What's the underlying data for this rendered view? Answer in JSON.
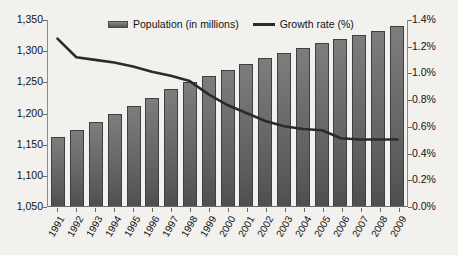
{
  "chart_data": {
    "type": "bar",
    "title": "",
    "xlabel": "",
    "ylabel": "",
    "grid": false,
    "legend_position": "top-center",
    "categories": [
      "1991",
      "1992",
      "1993",
      "1994",
      "1995",
      "1996",
      "1997",
      "1998",
      "1999",
      "2000",
      "2001",
      "2002",
      "2003",
      "2004",
      "2005",
      "2006",
      "2007",
      "2008",
      "2009"
    ],
    "series": [
      {
        "name": "Population (in millions)",
        "type": "bar",
        "axis": "left",
        "unit": "millions",
        "color": "#6e6e6e",
        "values": [
          1160,
          1172,
          1185,
          1198,
          1211,
          1224,
          1237,
          1249,
          1259,
          1268,
          1278,
          1287,
          1295,
          1303,
          1311,
          1318,
          1324,
          1331,
          1338
        ]
      },
      {
        "name": "Growth rate (%)",
        "type": "line",
        "axis": "right",
        "unit": "%",
        "color": "#2b2b2b",
        "values": [
          1.26,
          1.12,
          1.1,
          1.08,
          1.05,
          1.01,
          0.98,
          0.94,
          0.84,
          0.76,
          0.7,
          0.64,
          0.6,
          0.58,
          0.57,
          0.51,
          0.5,
          0.5,
          0.5
        ]
      }
    ],
    "left_axis": {
      "min": 1050,
      "max": 1350,
      "step": 50,
      "ticks": [
        1050,
        1100,
        1150,
        1200,
        1250,
        1300,
        1350
      ],
      "tick_labels": [
        "1,050",
        "1,100",
        "1,150",
        "1,200",
        "1,250",
        "1,300",
        "1,350"
      ]
    },
    "right_axis": {
      "min": 0.0,
      "max": 1.4,
      "step": 0.2,
      "ticks": [
        0.0,
        0.2,
        0.4,
        0.6,
        0.8,
        1.0,
        1.2,
        1.4
      ],
      "tick_labels": [
        "0.0%",
        "0.2%",
        "0.4%",
        "0.6%",
        "0.8%",
        "1.0%",
        "1.2%",
        "1.4%"
      ]
    },
    "legend": [
      {
        "label": "Population (in millions)",
        "marker": "bar-swatch"
      },
      {
        "label": "Growth rate (%)",
        "marker": "line-swatch"
      }
    ]
  }
}
